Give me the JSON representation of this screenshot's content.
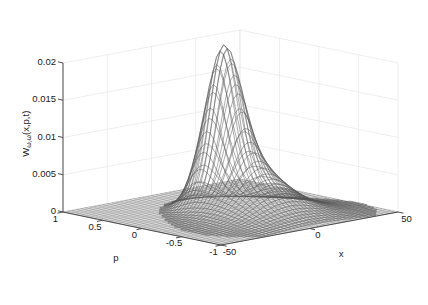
{
  "figure": {
    "background_color": "#ffffff",
    "axis_color": "#4d4d4d",
    "grid_color": "#e8e8e8",
    "mesh_color": "#555555",
    "floor_color": "#6a6a6a"
  },
  "chart_data": {
    "type": "surface",
    "title": "",
    "xlabel": "x",
    "ylabel": "p",
    "zlabel": "W",
    "zlabel_subscript": "ω,ω",
    "zlabel_args": "(x,p,t)",
    "zlabel_full": "Wω,ω(x,p,t)",
    "xlim": [
      -50,
      50
    ],
    "ylim": [
      -1,
      1
    ],
    "zlim": [
      0,
      0.02
    ],
    "xticks": [
      -50,
      0,
      50
    ],
    "xtick_labels": [
      "-50",
      "0",
      "50"
    ],
    "yticks": [
      1,
      0.5,
      0,
      -0.5,
      -1
    ],
    "ytick_labels": [
      "1",
      "0.5",
      "0",
      "-0.5",
      "-1"
    ],
    "zticks": [
      0,
      0.005,
      0.01,
      0.015,
      0.02
    ],
    "ztick_labels": [
      "0",
      "0.005",
      "0.01",
      "0.015",
      "0.02"
    ],
    "grid": true,
    "legend": "none",
    "view_azimuth": -37.5,
    "view_elevation": 30,
    "peak_value": 0.0188,
    "peak_x": 0,
    "peak_p": 0.1,
    "secondary_peak_value": 0.0105,
    "tertiary_peak_value": 0.0015,
    "surface_description": "Gaussian-like Wigner distribution with a single dominant narrow central peak decaying to zero across the x-p plane",
    "nx": 41,
    "np": 41,
    "x_samples": [
      -50,
      -45,
      -40,
      -35,
      -30,
      -25,
      -20,
      -15,
      -10,
      -5,
      0,
      5,
      10,
      15,
      20,
      25,
      30,
      35,
      40,
      45,
      50
    ],
    "p_samples": [
      -1,
      -0.9,
      -0.8,
      -0.7,
      -0.6,
      -0.5,
      -0.4,
      -0.3,
      -0.2,
      -0.1,
      0,
      0.1,
      0.2,
      0.3,
      0.4,
      0.5,
      0.6,
      0.7,
      0.8,
      0.9,
      1
    ],
    "sigma_x": 7.5,
    "sigma_p": 0.17,
    "amplitude": 0.0188
  }
}
